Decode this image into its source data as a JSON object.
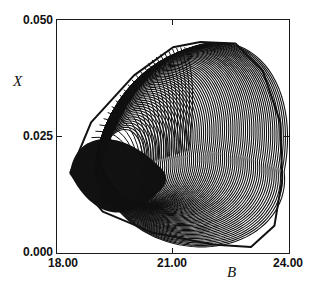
{
  "chart_data": {
    "type": "line",
    "title": "",
    "xlabel": "B",
    "ylabel": "X",
    "xlim": [
      18.0,
      24.0
    ],
    "ylim": [
      0.0,
      0.05
    ],
    "x_ticks": [
      "18.00",
      "21.00",
      "24.00"
    ],
    "y_ticks": [
      "0.000",
      "0.025",
      "0.050"
    ],
    "grid": false,
    "legend": null,
    "series": [
      {
        "name": "trajectory",
        "color": "#111111",
        "envelope_points": [
          {
            "B": 18.36,
            "X": 0.0172
          },
          {
            "B": 18.9,
            "X": 0.028
          },
          {
            "B": 20.0,
            "X": 0.038
          },
          {
            "B": 21.0,
            "X": 0.044
          },
          {
            "B": 21.7,
            "X": 0.0451
          },
          {
            "B": 22.6,
            "X": 0.0448
          },
          {
            "B": 23.3,
            "X": 0.039
          },
          {
            "B": 23.75,
            "X": 0.028
          },
          {
            "B": 23.8,
            "X": 0.016
          },
          {
            "B": 23.6,
            "X": 0.006
          },
          {
            "B": 23.0,
            "X": 0.0015
          },
          {
            "B": 22.0,
            "X": 0.002
          },
          {
            "B": 20.5,
            "X": 0.0045
          },
          {
            "B": 19.2,
            "X": 0.009
          },
          {
            "B": 18.36,
            "X": 0.0172
          }
        ],
        "dense_region": {
          "B_range": [
            18.4,
            20.6
          ],
          "X_range": [
            0.008,
            0.026
          ]
        },
        "inner_hole_center": {
          "B": 21.3,
          "X": 0.017
        }
      }
    ]
  },
  "axes": {
    "x_title": "B",
    "y_title": "X",
    "x_tick_labels": [
      "18.00",
      "21.00",
      "24.00"
    ],
    "y_tick_labels": [
      "0.000",
      "0.025",
      "0.050"
    ]
  }
}
